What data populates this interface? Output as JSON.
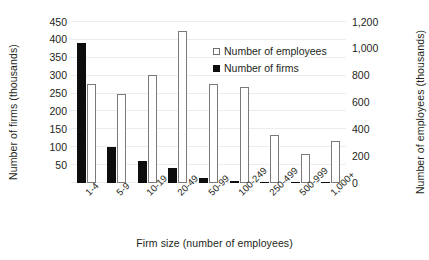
{
  "chart_data": {
    "type": "bar",
    "title": "",
    "xlabel": "Firm size (number of employees)",
    "ylabel": "Number of firms (thousands)",
    "y2label": "Number of employees (thousands)",
    "categories": [
      "1-4",
      "5-9",
      "10-19",
      "20-49",
      "50-99",
      "100-249",
      "250-499",
      "500-999",
      "1,000+"
    ],
    "series": [
      {
        "name": "Number of employees",
        "axis": "right",
        "units": "thousands",
        "values": [
          738,
          667,
          805,
          1133,
          738,
          715,
          360,
          213,
          312
        ]
      },
      {
        "name": "Number of firms",
        "axis": "left",
        "units": "thousands",
        "values": [
          390,
          100,
          62,
          42,
          14,
          6,
          2,
          1,
          1
        ]
      }
    ],
    "ylim": [
      0,
      450
    ],
    "y2lim": [
      0,
      1200
    ],
    "yticks": [
      "0",
      "50",
      "100",
      "150",
      "200",
      "250",
      "300",
      "350",
      "400",
      "450"
    ],
    "y2ticks": [
      "0",
      "200",
      "400",
      "600",
      "800",
      "1,000",
      "1,200"
    ],
    "grid": true,
    "legend_position": "inside-top-right"
  },
  "legend": {
    "entries": [
      {
        "label": "Number of employees",
        "marker": "open-square"
      },
      {
        "label": "Number of firms",
        "marker": "filled-square"
      }
    ]
  },
  "colors": {
    "firms": "#0d0d0d",
    "employees_fill": "#ffffff",
    "employees_stroke": "#7a7a7a",
    "gridline": "#ededed",
    "axis": "#6f6f6f",
    "text": "#231f20"
  }
}
